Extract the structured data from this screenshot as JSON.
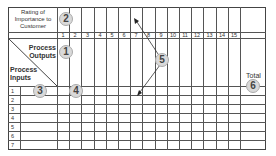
{
  "header": {
    "rating_label_line1": "Rating of",
    "rating_label_line2": "Importance to",
    "rating_label_line3": "Customer"
  },
  "corner": {
    "outputs_line1": "Process",
    "outputs_line2": "Outputs",
    "inputs_line1": "Process",
    "inputs_line2": "Inputs"
  },
  "columns": [
    "1",
    "2",
    "3",
    "4",
    "5",
    "6",
    "7",
    "8",
    "9",
    "10",
    "11",
    "12",
    "13",
    "14",
    "15"
  ],
  "total_label": "Total",
  "rows": [
    "1",
    "2",
    "3",
    "4",
    "5",
    "6",
    "7"
  ],
  "callouts": {
    "c1": "1",
    "c2": "2",
    "c3": "3",
    "c4": "4",
    "c5": "5",
    "c6": "6"
  },
  "colors": {
    "grid": "#555555",
    "callout_fill": "#d9d9d9",
    "text": "#333333"
  }
}
